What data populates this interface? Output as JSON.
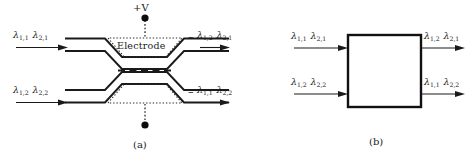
{
  "figure": {
    "title_a": "(a)",
    "title_b": "(b)",
    "voltage_label": "+V",
    "electrode_label": "Electrode",
    "minus_symbol": "–",
    "lambda": "λ",
    "panel_a": {
      "inputs": [
        {
          "id": "in-top",
          "terms": [
            {
              "base": "λ",
              "sub": "1,1"
            },
            {
              "base": "λ",
              "sub": "2,1"
            }
          ]
        },
        {
          "id": "in-bottom",
          "terms": [
            {
              "base": "λ",
              "sub": "1,2"
            },
            {
              "base": "λ",
              "sub": "2,2"
            }
          ]
        }
      ],
      "outputs": [
        {
          "id": "out-top",
          "terms": [
            {
              "base": "λ",
              "sub": "1,2"
            },
            {
              "base": "λ",
              "sub": "2,1"
            }
          ]
        },
        {
          "id": "out-bottom",
          "terms": [
            {
              "base": "λ",
              "sub": "1,1"
            },
            {
              "base": "λ",
              "sub": "2,2"
            }
          ]
        }
      ]
    },
    "panel_b": {
      "inputs": [
        {
          "id": "in-top",
          "terms": [
            {
              "base": "λ",
              "sub": "1,1"
            },
            {
              "base": "λ",
              "sub": "2,1"
            }
          ]
        },
        {
          "id": "in-bottom",
          "terms": [
            {
              "base": "λ",
              "sub": "1,2"
            },
            {
              "base": "λ",
              "sub": "2,2"
            }
          ]
        }
      ],
      "outputs": [
        {
          "id": "out-top",
          "terms": [
            {
              "base": "λ",
              "sub": "1,2"
            },
            {
              "base": "λ",
              "sub": "2,1"
            }
          ]
        },
        {
          "id": "out-bottom",
          "terms": [
            {
              "base": "λ",
              "sub": "1,1"
            },
            {
              "base": "λ",
              "sub": "2,2"
            }
          ]
        }
      ]
    },
    "colors": {
      "line": "#1a1a1a",
      "dotted": "#3a3a3a",
      "background": "#ffffff"
    }
  }
}
